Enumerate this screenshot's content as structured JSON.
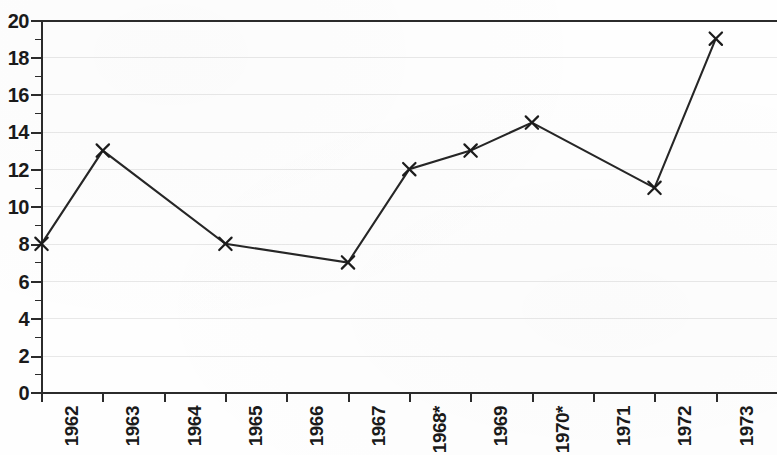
{
  "chart_data": {
    "type": "line",
    "title": "",
    "subtitle": "",
    "xlabel": "",
    "ylabel": "",
    "xlim": [
      1962,
      1973
    ],
    "ylim": [
      0,
      20
    ],
    "grid": true,
    "legend": false,
    "marker": "x",
    "line_color": "#262626",
    "grid_color": "#e8e8e8",
    "axis_color": "#2b2b2b",
    "categories": [
      "1962",
      "1963",
      "1964",
      "1965",
      "1966",
      "1967",
      "1968*",
      "1969",
      "1970*",
      "1971",
      "1972",
      "1973"
    ],
    "x_tick_labels": [
      "1962",
      "1963",
      "1964",
      "1965",
      "1966",
      "1967",
      "1968*",
      "1969",
      "1970*",
      "1971",
      "1972",
      "1973"
    ],
    "y_tick_labels": [
      "0",
      "2",
      "4",
      "6",
      "8",
      "10",
      "12",
      "14",
      "16",
      "18",
      "20"
    ],
    "y_major_ticks": [
      0,
      2,
      4,
      6,
      8,
      10,
      12,
      14,
      16,
      18,
      20
    ],
    "y_minor_ticks": [
      1,
      3,
      5,
      7,
      9,
      11,
      13,
      15,
      17,
      19
    ],
    "values": [
      8,
      13,
      null,
      8,
      null,
      7,
      12,
      13,
      14.5,
      null,
      11,
      19
    ],
    "series": [
      {
        "name": "",
        "points": [
          {
            "x": "1962",
            "y": 8,
            "marker": true
          },
          {
            "x": "1963",
            "y": 13,
            "marker": true
          },
          {
            "x": "1965",
            "y": 8,
            "marker": true
          },
          {
            "x": "1967",
            "y": 7,
            "marker": true
          },
          {
            "x": "1968*",
            "y": 12,
            "marker": true
          },
          {
            "x": "1969",
            "y": 13,
            "marker": true
          },
          {
            "x": "1970*",
            "y": 14.5,
            "marker": true
          },
          {
            "x": "1972",
            "y": 11,
            "marker": true
          },
          {
            "x": "1973",
            "y": 19,
            "marker": true
          }
        ]
      }
    ]
  }
}
